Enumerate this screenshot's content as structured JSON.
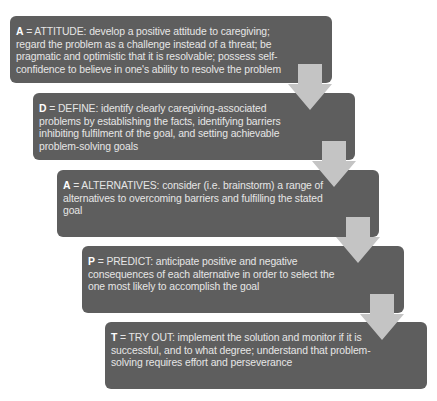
{
  "diagram": {
    "type": "step-flow",
    "colors": {
      "box_fill": "#5e5e5e",
      "box_text": "#e6e6e6",
      "arrow_fill": "#c4c4c4",
      "background": "#ffffff"
    },
    "steps": [
      {
        "letter": "A",
        "rest": " = ATTITUDE: develop a positive attitude to caregiving; regard the problem as a challenge instead of a threat; be pragmatic and optimistic that it is resolvable; possess self-confidence to believe in one's ability to resolve the problem"
      },
      {
        "letter": "D",
        "rest": " = DEFINE: identify clearly caregiving-associated problems by establishing the facts, identifying barriers inhibiting fulfilment of the goal, and setting achievable problem-solving goals"
      },
      {
        "letter": "A",
        "rest": " = ALTERNATIVES: consider (i.e. brainstorm) a range of alternatives to overcoming barriers and fulfilling the stated goal"
      },
      {
        "letter": "P",
        "rest": " = PREDICT: anticipate positive and negative consequences of each alternative in order to select the one most likely to accomplish the goal"
      },
      {
        "letter": "T",
        "rest": " = TRY OUT: implement the solution and monitor if it is successful, and to what degree; understand that problem-solving requires effort and perseverance"
      }
    ],
    "arrows": [
      {
        "icon": "down-arrow-icon",
        "from": 0,
        "to": 1
      },
      {
        "icon": "down-arrow-icon",
        "from": 1,
        "to": 2
      },
      {
        "icon": "down-arrow-icon",
        "from": 2,
        "to": 3
      },
      {
        "icon": "down-arrow-icon",
        "from": 3,
        "to": 4
      }
    ]
  }
}
